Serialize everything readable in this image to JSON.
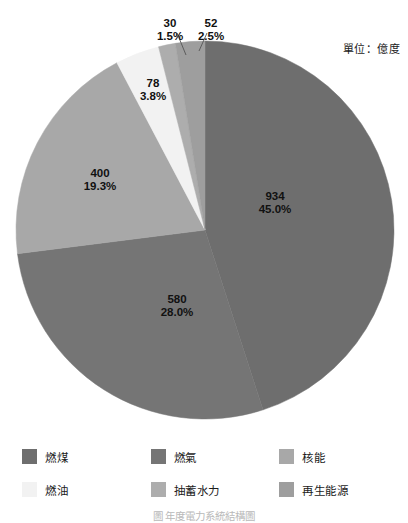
{
  "annotation": {
    "unit_note": "單位：億度"
  },
  "caption": {
    "text": "圖         年度電力系統結構圖"
  },
  "legend": {
    "items": [
      {
        "label": "燃煤",
        "color": "#6e6e6e"
      },
      {
        "label": "燃氣",
        "color": "#757575"
      },
      {
        "label": "核能",
        "color": "#a8a8a8"
      },
      {
        "label": "燃油",
        "color": "#f2f2f2"
      },
      {
        "label": "抽蓄水力",
        "color": "#adadad"
      },
      {
        "label": "再生能源",
        "color": "#9e9e9e"
      }
    ]
  },
  "chart_data": {
    "type": "pie",
    "title": "",
    "unit": "億度",
    "legend_position": "bottom",
    "start_angle_deg": 0,
    "direction": "clockwise",
    "total": 2074,
    "labels": [
      "燃煤",
      "燃氣",
      "核能",
      "燃油",
      "抽蓄水力",
      "再生能源"
    ],
    "values": [
      934,
      580,
      400,
      78,
      30,
      52
    ],
    "percent_labels": [
      "45.0%",
      "28.0%",
      "19.3%",
      "3.8%",
      "1.5%",
      "2.5%"
    ],
    "percents": [
      45.0,
      28.0,
      19.3,
      3.8,
      1.5,
      2.5
    ],
    "colors": [
      "#6e6e6e",
      "#757575",
      "#a8a8a8",
      "#f2f2f2",
      "#adadad",
      "#9e9e9e"
    ],
    "slices": [
      {
        "name": "燃煤",
        "value": "934",
        "percent": "45.0%",
        "color": "#6e6e6e",
        "label_x": 275,
        "label_y": 200,
        "label_inside": true,
        "leader": false
      },
      {
        "name": "燃氣",
        "value": "580",
        "percent": "28.0%",
        "color": "#757575",
        "label_x": 177,
        "label_y": 303,
        "label_inside": true,
        "leader": false
      },
      {
        "name": "核能",
        "value": "400",
        "percent": "19.3%",
        "color": "#a8a8a8",
        "label_x": 100,
        "label_y": 177,
        "label_inside": true,
        "leader": false
      },
      {
        "name": "燃油",
        "value": "78",
        "percent": "3.8%",
        "color": "#f2f2f2",
        "label_x": 153,
        "label_y": 87,
        "label_inside": true,
        "leader": false
      },
      {
        "name": "抽蓄水力",
        "value": "30",
        "percent": "1.5%",
        "color": "#adadad",
        "label_x": 170,
        "label_y": 27,
        "label_inside": false,
        "leader": true,
        "leader_x1": 177,
        "leader_y1": 33,
        "leader_x2": 186,
        "leader_y2": 55
      },
      {
        "name": "再生能源",
        "value": "52",
        "percent": "2.5%",
        "color": "#9e9e9e",
        "label_x": 211,
        "label_y": 27,
        "label_inside": false,
        "leader": true,
        "leader_x1": 207,
        "leader_y1": 33,
        "leader_x2": 199,
        "leader_y2": 51
      }
    ]
  }
}
